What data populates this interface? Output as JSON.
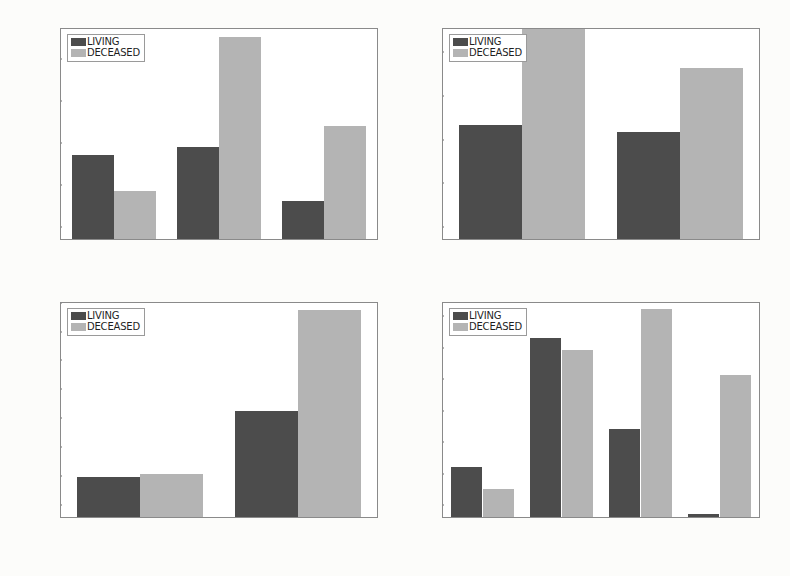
{
  "figure": {
    "background": "#fcfcfa",
    "legend_labels": [
      "LIVING",
      "DECEASED"
    ],
    "series_colors": {
      "living": "#4c4c4c",
      "deceased": "#b4b4b4"
    }
  },
  "chart_data": [
    {
      "type": "bar",
      "title": "",
      "xlabel": "ELN risk classification",
      "ylabel": "",
      "categories": [
        "Favorable",
        "Intermediate",
        "High"
      ],
      "series": [
        {
          "name": "LIVING",
          "values": [
            40,
            44,
            18
          ]
        },
        {
          "name": "DECEASED",
          "values": [
            23,
            96,
            54
          ]
        }
      ],
      "yticks": [
        0,
        20,
        40,
        60,
        80,
        100
      ],
      "ylim": [
        0,
        100
      ],
      "grid": false,
      "legend_position": "upper left"
    },
    {
      "type": "bar",
      "title": "",
      "xlabel": "Gender",
      "ylabel": "",
      "categories": [
        "Male",
        "Female"
      ],
      "series": [
        {
          "name": "LIVING",
          "values": [
            52,
            49
          ]
        },
        {
          "name": "DECEASED",
          "values": [
            96,
            78
          ]
        }
      ],
      "yticks": [
        0,
        20,
        40,
        60,
        80
      ],
      "ylim": [
        0,
        96
      ],
      "grid": false,
      "legend_position": "upper left"
    },
    {
      "type": "bar",
      "title": "",
      "xlabel": "Race",
      "ylabel": "",
      "categories": [
        "Other",
        "White"
      ],
      "series": [
        {
          "name": "LIVING",
          "values": [
            28,
            73
          ]
        },
        {
          "name": "DECEASED",
          "values": [
            30,
            143
          ]
        }
      ],
      "yticks": [
        0,
        20,
        40,
        60,
        80,
        100,
        120,
        140
      ],
      "ylim": [
        0,
        148
      ],
      "grid": false,
      "legend_position": "upper left"
    },
    {
      "type": "bar",
      "title": "",
      "xlabel": "Treatment intensity",
      "ylabel": "",
      "categories": [
        "Target therapy",
        "High intensity",
        "Regular",
        "Low intensity"
      ],
      "series": [
        {
          "name": "LIVING",
          "values": [
            16,
            57,
            28,
            1
          ]
        },
        {
          "name": "DECEASED",
          "values": [
            9,
            53,
            66,
            45
          ]
        }
      ],
      "yticks": [
        0,
        10,
        20,
        30,
        40,
        50,
        60
      ],
      "ylim": [
        0,
        68
      ],
      "grid": false,
      "legend_position": "upper left"
    }
  ]
}
